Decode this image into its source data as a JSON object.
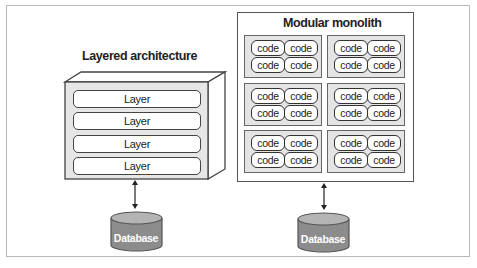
{
  "diagram": {
    "left": {
      "title": "Layered architecture",
      "layers": [
        "Layer",
        "Layer",
        "Layer",
        "Layer"
      ],
      "database_label": "Database"
    },
    "right": {
      "title": "Modular monolith",
      "modules": [
        {
          "code": [
            "code",
            "code",
            "code",
            "code"
          ]
        },
        {
          "code": [
            "code",
            "code",
            "code",
            "code"
          ]
        },
        {
          "code": [
            "code",
            "code",
            "code",
            "code"
          ]
        },
        {
          "code": [
            "code",
            "code",
            "code",
            "code"
          ]
        },
        {
          "code": [
            "code",
            "code",
            "code",
            "code"
          ]
        },
        {
          "code": [
            "code",
            "code",
            "code",
            "code"
          ]
        }
      ],
      "database_label": "Database"
    },
    "colors": {
      "module_fill": "#e4e4e4",
      "database_fill": "#8c8c8c",
      "database_top": "#b4b4b4",
      "outline": "#444444"
    }
  }
}
